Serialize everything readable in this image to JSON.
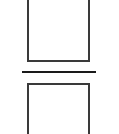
{
  "diagram": {
    "type": "fraction-boxes",
    "top_box": {
      "label": ""
    },
    "divider": {
      "orientation": "horizontal"
    },
    "bottom_box": {
      "label": ""
    },
    "colors": {
      "stroke": "#3a3a3a",
      "divider": "#1a1a1a",
      "background": "#ffffff"
    }
  }
}
